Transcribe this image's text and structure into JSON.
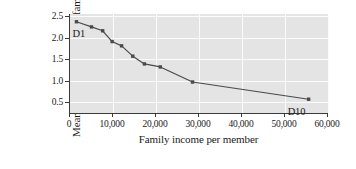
{
  "chart_data": {
    "type": "line",
    "title": "",
    "xlabel": "Family income per member",
    "ylabel_lines": [
      "Mean number of",
      "children in family"
    ],
    "ylabel": "Mean number of children in family",
    "xlim": [
      0,
      60000
    ],
    "ylim": [
      0.25,
      2.55
    ],
    "grid": true,
    "legend": "none",
    "xticks": [
      0,
      10000,
      20000,
      30000,
      40000,
      50000,
      60000
    ],
    "xticklabels": [
      "0",
      "10,000",
      "20,000",
      "30,000",
      "40,000",
      "50,000",
      "60,000"
    ],
    "yticks": [
      0.5,
      1.0,
      1.5,
      2.0,
      2.5
    ],
    "yticklabels": [
      "0.5",
      "1.0",
      "1.5",
      "2.0",
      "2.5"
    ],
    "series": [
      {
        "name": "Mean number of children in family",
        "marker": "square",
        "color": "#4a4a4a",
        "x": [
          1500,
          5000,
          7600,
          9800,
          12000,
          14600,
          17300,
          21000,
          28500,
          55500
        ],
        "y": [
          2.37,
          2.25,
          2.16,
          1.91,
          1.81,
          1.57,
          1.39,
          1.32,
          0.97,
          0.57
        ]
      }
    ],
    "annotations": [
      {
        "text": "D1",
        "x": 1500,
        "y": 2.37,
        "placement": "below-right-of-first-point"
      },
      {
        "text": "D10",
        "x": 55500,
        "y": 0.57,
        "placement": "below-left-of-last-point"
      }
    ],
    "colors": {
      "plot_background": "#e4e4e4",
      "gridline": "#fbfbfb",
      "axis": "#3a3a3a",
      "series": "#4a4a4a",
      "figure_background": "#ffffff"
    }
  }
}
